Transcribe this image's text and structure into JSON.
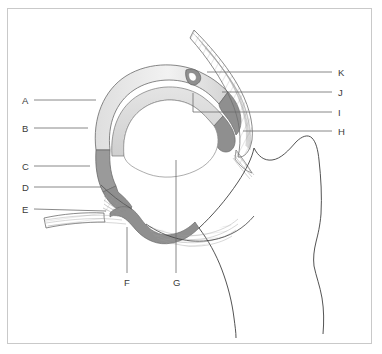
{
  "figure": {
    "frame": {
      "stroke": "#c9c9c9",
      "background": "#ffffff"
    },
    "palette": {
      "outline": "#5a5a5a",
      "bone_outline": "#3f3f3f",
      "cartilage_light": "#e8e8e8",
      "cartilage_mid": "#cfcfcf",
      "labrum_dark": "#8f8f8f",
      "capsule_fiber": "#9a9a9a",
      "leader_line": "#6b6b6b",
      "label_text": "#3a3a3a"
    }
  },
  "labels": [
    {
      "id": "A",
      "text": "A",
      "side": "left",
      "x": 22,
      "y": 96,
      "leader": {
        "x1": 34,
        "y1": 100,
        "x2": 96,
        "y2": 100
      }
    },
    {
      "id": "B",
      "text": "B",
      "side": "left",
      "x": 22,
      "y": 124,
      "leader": {
        "x1": 34,
        "y1": 128,
        "x2": 88,
        "y2": 128
      }
    },
    {
      "id": "C",
      "text": "C",
      "side": "left",
      "x": 22,
      "y": 162,
      "leader": {
        "x1": 34,
        "y1": 166,
        "x2": 90,
        "y2": 166
      }
    },
    {
      "id": "D",
      "text": "D",
      "side": "left",
      "x": 22,
      "y": 183,
      "leader": {
        "x1": 34,
        "y1": 187,
        "x2": 101,
        "y2": 187
      }
    },
    {
      "id": "E",
      "text": "E",
      "side": "left",
      "x": 22,
      "y": 205,
      "leader": {
        "x1": 34,
        "y1": 209,
        "x2": 106,
        "y2": 211
      }
    },
    {
      "id": "F",
      "text": "F",
      "side": "bottom",
      "x": 124,
      "y": 278,
      "leader": {
        "x1": 127,
        "y1": 227,
        "x2": 127,
        "y2": 273
      }
    },
    {
      "id": "G",
      "text": "G",
      "side": "bottom",
      "x": 173,
      "y": 278,
      "leader": {
        "x1": 176,
        "y1": 160,
        "x2": 176,
        "y2": 273
      }
    },
    {
      "id": "H",
      "text": "H",
      "side": "right",
      "x": 338,
      "y": 127,
      "leader": {
        "x1": 243,
        "y1": 131,
        "x2": 332,
        "y2": 131
      }
    },
    {
      "id": "I",
      "text": "I",
      "side": "right",
      "x": 338,
      "y": 108,
      "leader": {
        "x1": 193,
        "y1": 112,
        "x2": 332,
        "y2": 112
      }
    },
    {
      "id": "J",
      "text": "J",
      "side": "right",
      "x": 338,
      "y": 88,
      "leader": {
        "x1": 222,
        "y1": 92,
        "x2": 332,
        "y2": 92
      }
    },
    {
      "id": "K",
      "text": "K",
      "side": "right",
      "x": 338,
      "y": 68,
      "leader": {
        "x1": 207,
        "y1": 72,
        "x2": 332,
        "y2": 72
      }
    }
  ],
  "leader_bends": [
    {
      "id": "I-bend",
      "x": 193,
      "y1": 93,
      "y2": 112
    }
  ]
}
